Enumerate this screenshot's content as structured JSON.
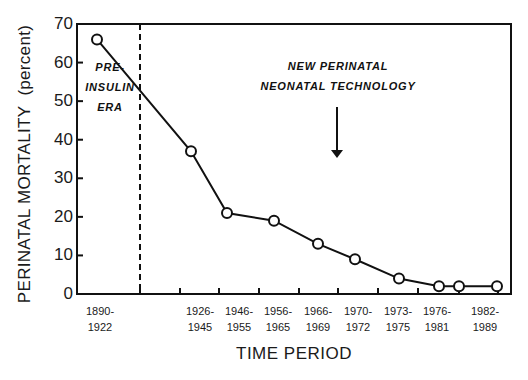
{
  "chart_data": {
    "type": "line",
    "title": "",
    "xlabel": "TIME PERIOD",
    "ylabel": "PERINATAL MORTALITY (percent)",
    "ylim": [
      0,
      70
    ],
    "yticks": [
      "0",
      "10",
      "20",
      "30",
      "40",
      "50",
      "60",
      "70"
    ],
    "grid": false,
    "legend": null,
    "categories": [
      [
        "1890-",
        "1922"
      ],
      [
        "1926-",
        "1945"
      ],
      [
        "1946-",
        "1955"
      ],
      [
        "1956-",
        "1965"
      ],
      [
        "1966-",
        "1969"
      ],
      [
        "1970-",
        "1972"
      ],
      [
        "1973-",
        "1975"
      ],
      [
        "1976-",
        "1981"
      ],
      [
        "1982-",
        "1989"
      ]
    ],
    "series": [
      {
        "name": "Perinatal mortality",
        "marker": "open-circle",
        "points": [
          {
            "period": "1890-1922",
            "value": 66
          },
          {
            "period": "1926-1945",
            "value": 37
          },
          {
            "period": "1946-1955",
            "value": 21
          },
          {
            "period": "1956-1965",
            "value": 19
          },
          {
            "period": "1966-1969",
            "value": 13
          },
          {
            "period": "1970-1972",
            "value": 9
          },
          {
            "period": "1973-1975",
            "value": 4
          },
          {
            "period": "1976-1981",
            "value": 2
          },
          {
            "period": "1976-1981",
            "value": 2
          },
          {
            "period": "1982-1989",
            "value": 2
          }
        ]
      }
    ],
    "annotations": [
      {
        "text": [
          "PRE-",
          "INSULIN",
          "ERA"
        ],
        "type": "region-label",
        "boundary": "dashed vertical line"
      },
      {
        "text": [
          "NEW PERINATAL",
          "NEONATAL TECHNOLOGY"
        ],
        "type": "arrow-label",
        "arrow": "down"
      }
    ]
  },
  "labels": {
    "ylabel_main": "PERINATAL MORTALITY",
    "ylabel_unit": "(percent)",
    "xlabel": "TIME PERIOD",
    "preinsulin": [
      "PRE-",
      "INSULIN",
      "ERA"
    ],
    "technology": [
      "NEW PERINATAL",
      "NEONATAL TECHNOLOGY"
    ]
  },
  "colors": {
    "line": "#111111",
    "axis": "#111111",
    "background": "#ffffff"
  }
}
